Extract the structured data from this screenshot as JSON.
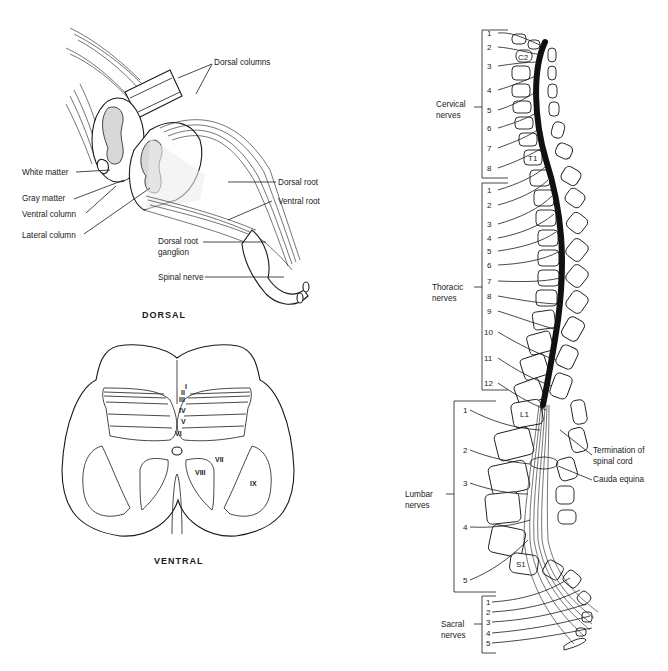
{
  "dorsal_figure": {
    "labels": {
      "dorsal_columns": "Dorsal columns",
      "white_matter": "White matter",
      "gray_matter": "Gray matter",
      "ventral_column": "Ventral column",
      "lateral_column": "Lateral column",
      "dorsal_root": "Dorsal root",
      "ventral_root": "Ventral root",
      "dorsal_root_ganglion_1": "Dorsal root",
      "dorsal_root_ganglion_2": "ganglion",
      "spinal_nerve": "Spinal nerve"
    },
    "caption": "DORSAL"
  },
  "cross_section": {
    "laminae": [
      "I",
      "II",
      "III",
      "IV",
      "V",
      "VI",
      "VII",
      "VIII",
      "IX"
    ],
    "caption": "VENTRAL"
  },
  "spine_figure": {
    "groups": {
      "cervical": {
        "label_1": "Cervical",
        "label_2": "nerves",
        "numbers": [
          "1",
          "2",
          "3",
          "4",
          "5",
          "6",
          "7",
          "8"
        ]
      },
      "thoracic": {
        "label_1": "Thoracic",
        "label_2": "nerves",
        "numbers": [
          "1",
          "2",
          "3",
          "4",
          "5",
          "6",
          "7",
          "8",
          "9",
          "10",
          "11",
          "12"
        ]
      },
      "lumbar": {
        "label_1": "Lumbar",
        "label_2": "nerves",
        "numbers": [
          "1",
          "2",
          "3",
          "4",
          "5"
        ]
      },
      "sacral": {
        "label_1": "Sacral",
        "label_2": "nerves",
        "numbers": [
          "1",
          "2",
          "3",
          "4",
          "5"
        ]
      }
    },
    "vertebra_labels": {
      "c2": "C2",
      "t1": "T1",
      "l1": "L1",
      "s1": "S1"
    },
    "annotations": {
      "termination_1": "Termination of",
      "termination_2": "spinal cord",
      "cauda_equina": "Cauda equina"
    }
  }
}
